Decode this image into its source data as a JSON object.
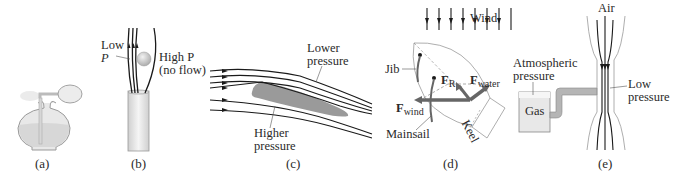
{
  "panels": [
    {
      "id": "a",
      "caption": "(a)",
      "subject": "perfume atomizer bottle"
    },
    {
      "id": "b",
      "caption": "(b)",
      "subject": "ball suspended in air jet",
      "labels": {
        "low_p_line1": "Low",
        "low_p_line2": "P",
        "high_p_line1": "High P",
        "high_p_line2": "(no flow)"
      }
    },
    {
      "id": "c",
      "caption": "(c)",
      "subject": "airfoil streamlines",
      "labels": {
        "lower_line1": "Lower",
        "lower_line2": "pressure",
        "higher_line1": "Higher",
        "higher_line2": "pressure"
      }
    },
    {
      "id": "d",
      "caption": "(d)",
      "subject": "sailboat forces",
      "labels": {
        "wind": "Wind",
        "jib": "Jib",
        "mainsail": "Mainsail",
        "keel": "Keel",
        "f_r": "F",
        "f_r_sub": "R",
        "f_water": "F",
        "f_water_sub": "water",
        "f_wind": "F",
        "f_wind_sub": "wind"
      }
    },
    {
      "id": "e",
      "caption": "(e)",
      "subject": "venturi / Bunsen gas flow",
      "labels": {
        "air": "Air",
        "atm_line1": "Atmospheric",
        "atm_line2": "pressure",
        "gas": "Gas",
        "low_line1": "Low",
        "low_line2": "pressure"
      }
    }
  ],
  "colors": {
    "line": "#1a1a1a",
    "gray_fill": "#9a9a9a",
    "light_fill": "#e4e4e4",
    "outline": "#8c8c8c"
  }
}
